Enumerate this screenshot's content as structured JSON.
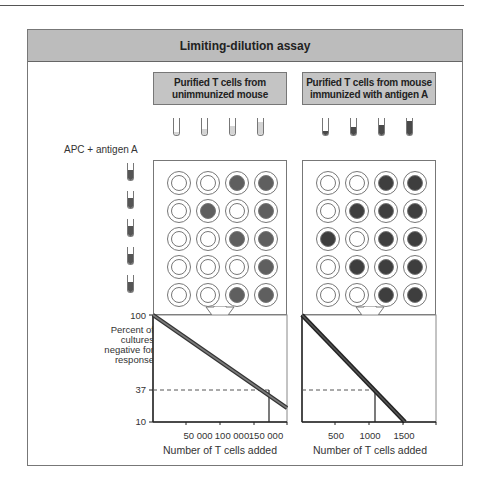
{
  "title": "Limiting-dilution assay",
  "sources": [
    {
      "label_line1": "Purified T cells from",
      "label_line2": "unimmunized mouse",
      "tube_fill_color": "#d4d4d4",
      "tube_fill_levels": [
        0.15,
        0.35,
        0.55,
        0.75
      ]
    },
    {
      "label_line1": "Purified T cells from mouse",
      "label_line2": "immunized with antigen A",
      "tube_fill_color": "#4a4a4a",
      "tube_fill_levels": [
        0.25,
        0.45,
        0.6,
        0.8
      ]
    }
  ],
  "apc": {
    "label": "APC + antigen A",
    "tube_count": 5,
    "fill_color": "#555555"
  },
  "plates": [
    {
      "name": "unimmunized",
      "rows": [
        [
          0,
          0,
          1,
          1
        ],
        [
          0,
          1,
          0,
          1
        ],
        [
          0,
          0,
          1,
          1
        ],
        [
          0,
          0,
          0,
          1
        ],
        [
          0,
          0,
          1,
          1
        ]
      ],
      "positive_color": "#5f5f5f"
    },
    {
      "name": "immunized",
      "rows": [
        [
          0,
          0,
          1,
          1
        ],
        [
          0,
          1,
          1,
          1
        ],
        [
          1,
          0,
          1,
          1
        ],
        [
          0,
          1,
          1,
          1
        ],
        [
          0,
          0,
          1,
          1
        ]
      ],
      "positive_color": "#3e3e3e"
    }
  ],
  "y_axis": {
    "label_lines": [
      "Percent of",
      "cultures",
      "negative for",
      "response"
    ],
    "ticks": [
      "100",
      "37",
      "10"
    ]
  },
  "chart_data": [
    {
      "type": "line",
      "title": "Purified T cells from unimmunized mouse",
      "xlabel": "Number of T cells added",
      "ylabel": "Percent of cultures negative for response",
      "x_ticks": [
        "50 000",
        "100 000",
        "150 000"
      ],
      "y_ticks": [
        100,
        37,
        10
      ],
      "yscale": "log",
      "xlim": [
        0,
        200000
      ],
      "ylim": [
        10,
        100
      ],
      "series": [
        {
          "name": "negative cultures",
          "x": [
            0,
            200000
          ],
          "y": [
            100,
            18
          ]
        }
      ],
      "annotation": {
        "y": 37,
        "x": 160000,
        "style": "dashed horizontal + vertical drop"
      }
    },
    {
      "type": "line",
      "title": "Purified T cells from mouse immunized with antigen A",
      "xlabel": "Number of T cells added",
      "ylabel": "Percent of cultures negative for response",
      "x_ticks": [
        "500",
        "1000",
        "1500"
      ],
      "y_ticks": [
        100,
        37,
        10
      ],
      "yscale": "log",
      "xlim": [
        0,
        2000
      ],
      "ylim": [
        10,
        100
      ],
      "series": [
        {
          "name": "negative cultures",
          "x": [
            0,
            1550
          ],
          "y": [
            100,
            10
          ]
        }
      ],
      "annotation": {
        "y": 37,
        "x": 1100,
        "style": "dashed horizontal + vertical drop"
      }
    }
  ]
}
